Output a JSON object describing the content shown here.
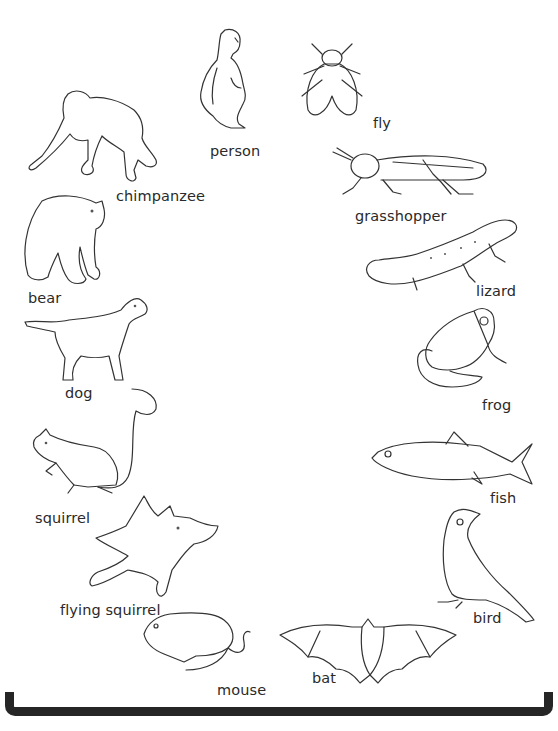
{
  "figure": {
    "type": "organism-arc-diagram",
    "bracket": {
      "color": "#262626"
    },
    "animals": [
      {
        "id": "person",
        "label": "person"
      },
      {
        "id": "fly",
        "label": "fly"
      },
      {
        "id": "chimpanzee",
        "label": "chimpanzee"
      },
      {
        "id": "grasshopper",
        "label": "grasshopper"
      },
      {
        "id": "bear",
        "label": "bear"
      },
      {
        "id": "lizard",
        "label": "lizard"
      },
      {
        "id": "dog",
        "label": "dog"
      },
      {
        "id": "frog",
        "label": "frog"
      },
      {
        "id": "squirrel",
        "label": "squirrel"
      },
      {
        "id": "fish",
        "label": "fish"
      },
      {
        "id": "flying-squirrel",
        "label": "flying squirrel"
      },
      {
        "id": "bird",
        "label": "bird"
      },
      {
        "id": "mouse",
        "label": "mouse"
      },
      {
        "id": "bat",
        "label": "bat"
      }
    ]
  }
}
